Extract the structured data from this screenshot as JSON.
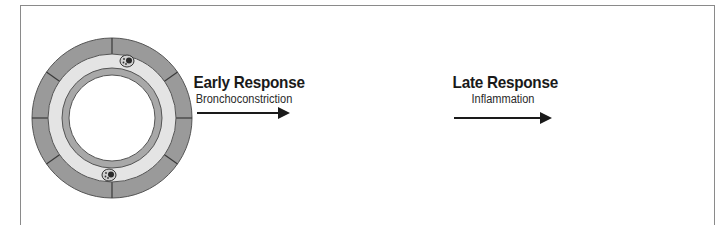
{
  "figure": {
    "stages": [
      {
        "id": "normal-airway",
        "label": ""
      },
      {
        "id": "early-response-airway",
        "label": ""
      },
      {
        "id": "late-response-airway",
        "label": ""
      }
    ],
    "transitions": [
      {
        "title": "Early Response",
        "subtitle": "Bronchoconstriction"
      },
      {
        "title": "Late Response",
        "subtitle": "Inflammation"
      }
    ],
    "colors": {
      "muscle_segment": "#9a9a9a",
      "segment_line": "#3a3a3a",
      "submucosa": "#e4e4e4",
      "epithelium": "#a8a8a8",
      "lumen": "#ffffff",
      "cell_dark": "#2a2a2a",
      "frame": "#8a8a8a",
      "text": "#1a1a1a"
    }
  }
}
